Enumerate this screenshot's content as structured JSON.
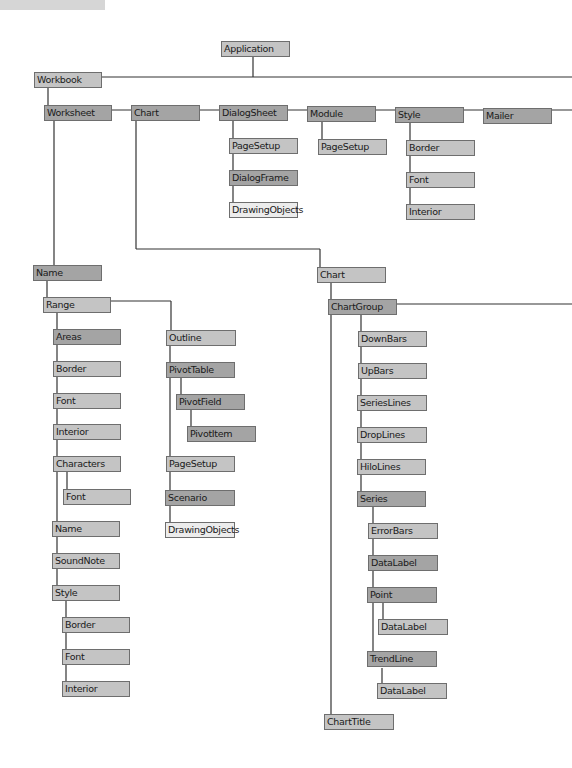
{
  "diagram": {
    "type": "object-model-hierarchy",
    "colors": {
      "collection_dark": "#a4a4a4",
      "object_mid": "#c4c4c4",
      "object_light": "#ececec",
      "line": "#333333"
    },
    "nodes": {
      "application": "Application",
      "workbook": "Workbook",
      "worksheet": "Worksheet",
      "chart_top": "Chart",
      "dialogsheet": "DialogSheet",
      "dialogsheet_pagesetup": "PageSetup",
      "dialogframe": "DialogFrame",
      "dialogsheet_drawingobjects": "DrawingObjects",
      "module": "Module",
      "module_pagesetup": "PageSetup",
      "style_top": "Style",
      "style_top_border": "Border",
      "style_top_font": "Font",
      "style_top_interior": "Interior",
      "mailer": "Mailer",
      "name": "Name",
      "range": "Range",
      "areas": "Areas",
      "range_border": "Border",
      "range_font": "Font",
      "range_interior": "Interior",
      "characters": "Characters",
      "characters_font": "Font",
      "range_name": "Name",
      "soundnote": "SoundNote",
      "range_style": "Style",
      "range_style_border": "Border",
      "range_style_font": "Font",
      "range_style_interior": "Interior",
      "outline": "Outline",
      "pivottable": "PivotTable",
      "pivotfield": "PivotField",
      "pivotitem": "PivotItem",
      "worksheet_pagesetup": "PageSetup",
      "scenario": "Scenario",
      "worksheet_drawingobjects": "DrawingObjects",
      "chart": "Chart",
      "chartgroup": "ChartGroup",
      "downbars": "DownBars",
      "upbars": "UpBars",
      "serieslines": "SeriesLines",
      "droplines": "DropLines",
      "hilolines": "HiloLines",
      "series": "Series",
      "errorbars": "ErrorBars",
      "series_datalabel": "DataLabel",
      "point": "Point",
      "point_datalabel": "DataLabel",
      "trendline": "TrendLine",
      "trendline_datalabel": "DataLabel",
      "charttitle": "ChartTitle"
    }
  }
}
